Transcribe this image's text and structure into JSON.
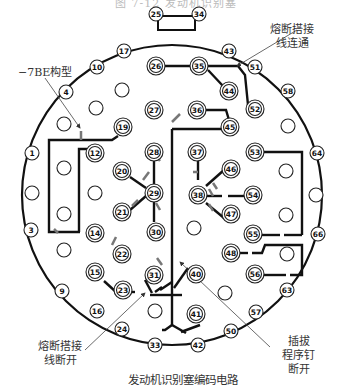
{
  "figure": {
    "top_title": "图 7-12  发动机识别塞",
    "caption": "发动机识别塞编码电路"
  },
  "annotations": {
    "bridge_connected": "熔断搭接线连通",
    "bridge_connected_line1": "熔断搭接",
    "bridge_connected_line2": "线连通",
    "model_label": "−7BE构型",
    "bridge_broken_line1": "熔断搭接",
    "bridge_broken_line2": "线断开",
    "pin_removed_line1": "插拔",
    "pin_removed_line2": "程序钉",
    "pin_removed_line3": "断开"
  },
  "pins": {
    "single_ring": [
      "1",
      "3",
      "4",
      "9",
      "10",
      "16",
      "17",
      "24",
      "25",
      "33",
      "34",
      "42",
      "43",
      "50",
      "51",
      "57",
      "58",
      "63",
      "64",
      "66"
    ],
    "double_ring": [
      "12",
      "14",
      "15",
      "19",
      "20",
      "21",
      "22",
      "23",
      "26",
      "27",
      "28",
      "29",
      "30",
      "31",
      "35",
      "36",
      "37",
      "38",
      "40",
      "41",
      "44",
      "45",
      "46",
      "47",
      "48",
      "52",
      "53",
      "54",
      "55",
      "56"
    ],
    "blank_count": 16
  },
  "colors": {
    "line": "#111111",
    "arrow": "#777777",
    "circle_stroke": "#222222",
    "background": "#ffffff"
  }
}
